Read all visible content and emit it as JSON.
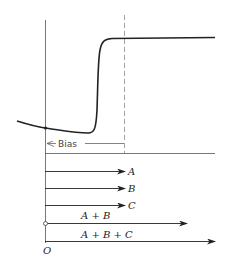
{
  "diagram": {
    "type": "bias-vector-addition",
    "bias_label": "Bias",
    "origin_label": "O",
    "vectors": [
      {
        "label": "A",
        "y": 171,
        "x_end": 125
      },
      {
        "label": "B",
        "y": 188,
        "x_end": 125
      },
      {
        "label": "C",
        "y": 205,
        "x_end": 125
      },
      {
        "label": "A + B",
        "y": 223,
        "x_end": 187
      },
      {
        "label": "A + B + C",
        "y": 241,
        "x_end": 215
      }
    ],
    "curve": {
      "description": "Nonlinear transfer characteristic: slowly falling, then sharp rise at threshold, then flat saturation",
      "color": "#222222"
    },
    "colors": {
      "line": "#222222",
      "axis": "#555555",
      "dashed": "#999999"
    }
  }
}
